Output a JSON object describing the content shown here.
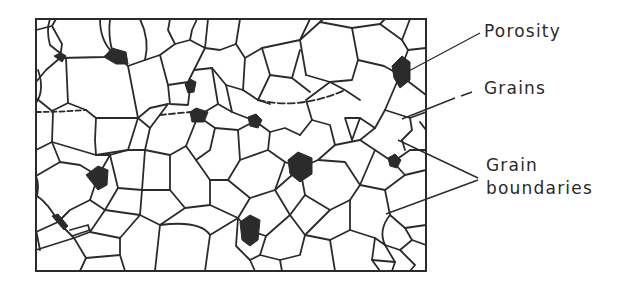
{
  "figure": {
    "type": "microstructure-schematic",
    "colors": {
      "line": "#2b2b2b",
      "pore": "#2b2b2b",
      "background": "#ffffff"
    },
    "frame": {
      "x": 36,
      "y": 19,
      "width": 390,
      "height": 252
    }
  },
  "labels": {
    "porosity": "Porosity",
    "grains": "Grains",
    "grain_boundaries_line1": "Grain",
    "grain_boundaries_line2": "boundaries"
  },
  "callouts": [
    {
      "label": "Porosity",
      "from": [
        480,
        33
      ],
      "to": [
        407,
        72
      ]
    },
    {
      "label": "Grains",
      "from": [
        474,
        91
      ],
      "to": [
        402,
        119
      ]
    },
    {
      "label": "Grain boundaries",
      "from": [
        478,
        178
      ],
      "to": [
        398,
        140
      ]
    },
    {
      "label": "Grain boundaries",
      "from": [
        478,
        180
      ],
      "to": [
        385,
        214
      ]
    }
  ]
}
